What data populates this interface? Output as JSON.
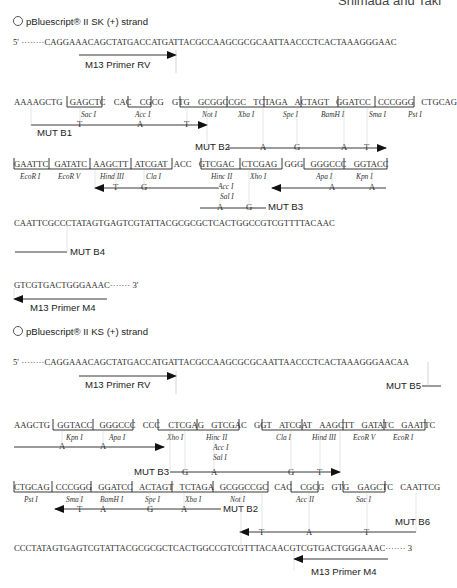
{
  "page": {
    "running_header": "Shimada and Taki"
  },
  "sk": {
    "title": "pBluescript® II SK (+) strand",
    "line1": {
      "prefix": "5'  ········",
      "seq": "CAGGAAACAGCTATGACCATGATTACGCCAAGCGCGCAATTAACCCTCACTAAAGGGAAC"
    },
    "primer_rv": "M13 Primer RV",
    "line2": {
      "lead": "AAAAGCTG",
      "sites": [
        "GAGCTC",
        "CAC",
        "CGCG",
        "GTG",
        "GCGGCCGC",
        "TCTAGA",
        "ACTAGT",
        "GGATCC",
        "CCCGGG",
        "CTGCAG"
      ],
      "enzymes": [
        "Sac I",
        "Acc I",
        "Not I",
        "Xba I",
        "Spe I",
        "BamH I",
        "Sma I",
        "Pst I"
      ]
    },
    "mut_b1": {
      "label": "MUT B1",
      "bases": [
        "T",
        "A",
        "T"
      ]
    },
    "mut_b2": {
      "label": "MUT B2",
      "bases": [
        "A",
        "G",
        "A",
        "T"
      ]
    },
    "line3": {
      "sites": [
        "GAATTC",
        "GATATC",
        "AAGCTT",
        "ATCGAT",
        "ACC",
        "GTCGAC",
        "CTCGAG",
        "GGG",
        "GGGCCC",
        "GGTACC"
      ],
      "enzymes": [
        "EcoR I",
        "EcoR V",
        "Hind III",
        "Cla I",
        "Hinc II",
        "Acc I",
        "Sal I",
        "Xho I",
        "Apa I",
        "Kpn I"
      ]
    },
    "mut_b3": {
      "label": "MUT B3",
      "bases": [
        "T",
        "G",
        "A",
        "G"
      ]
    },
    "mut_apa_kpn": {
      "bases": [
        "A",
        "A"
      ]
    },
    "line4": {
      "seq": "CAATTCGCCCTATAGTGAGTCGTATTACGCGCGCTCACTGGCCGTCGTTTTACAAC"
    },
    "mut_b4": {
      "label": "MUT B4"
    },
    "line5": {
      "seq": "GTCGTGACTGGGAAAC",
      "suffix": "·······   3'"
    },
    "primer_m4": "M13 Primer M4"
  },
  "ks": {
    "title": "pBluescript® II KS (+) strand",
    "line1": {
      "prefix": "5'  ········",
      "seq": "CAGGAAACAGCTATGACCATGATTACGCCAAGCGCGCAATTAACCCTCACTAAAGGGAACAA"
    },
    "primer_rv": "M13 Primer RV",
    "mut_b5": {
      "label": "MUT B5"
    },
    "line2": {
      "lead": "AAGCTG",
      "sites": [
        "GGTACC",
        "GGGCCC",
        "CCC",
        "CTCGAG",
        "GTCGAC",
        "GGT",
        "ATCGAT",
        "AAGCTT",
        "GATATC",
        "GAATTC"
      ],
      "enzymes": [
        "Kpn I",
        "Apa I",
        "Xho I",
        "Hinc II",
        "Acc I",
        "Sal I",
        "Cla I",
        "Hind III",
        "EcoR V",
        "EcoR I"
      ]
    },
    "mut_kpn_apa": {
      "bases": [
        "A",
        "A"
      ]
    },
    "mut_b3": {
      "label": "MUT B3",
      "bases": [
        "G",
        "A",
        "G",
        "T"
      ]
    },
    "line3": {
      "sites": [
        "CTGCAG",
        "CCCGGG",
        "GGATCC",
        "ACTAGT",
        "TCTAGA",
        "GCGGCCGC",
        "CAC",
        "CGCG",
        "GTG",
        "GAGCTC",
        "CAATTCG"
      ],
      "enzymes": [
        "Pst I",
        "Sma I",
        "BamH I",
        "Spe I",
        "Xba I",
        "Not I",
        "Acc II",
        "Sac I"
      ]
    },
    "mut_b2": {
      "label": "MUT B2",
      "bases": [
        "T",
        "A",
        "G",
        "A"
      ]
    },
    "mut_b6": {
      "label": "MUT B6",
      "bases": [
        "T",
        "A",
        "T"
      ]
    },
    "line4": {
      "seq": "CCCTATAGTGAGTCGTATTACGCGCGCTCACTGGCCGTCGTTTACAACGTCGTGACTGGGAAAC",
      "suffix": "·······   3"
    },
    "primer_m4": "M13 Primer M4"
  }
}
